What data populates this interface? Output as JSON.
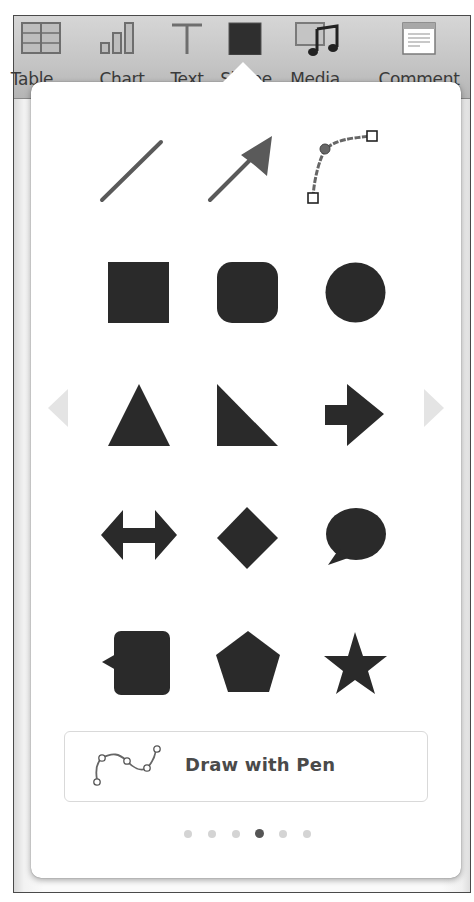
{
  "toolbar": {
    "items": [
      {
        "id": "table",
        "label": "Table",
        "icon": "table-icon"
      },
      {
        "id": "chart",
        "label": "Chart",
        "icon": "chart-icon"
      },
      {
        "id": "text",
        "label": "Text",
        "icon": "text-icon"
      },
      {
        "id": "shape",
        "label": "Shape",
        "icon": "shape-icon",
        "active": true
      },
      {
        "id": "media",
        "label": "Media",
        "icon": "media-icon"
      },
      {
        "id": "comment",
        "label": "Comment",
        "icon": "comment-icon"
      }
    ]
  },
  "shapes_popover": {
    "rows": [
      [
        "line",
        "arrow-line",
        "curve"
      ],
      [
        "square",
        "rounded-square",
        "circle"
      ],
      [
        "triangle",
        "right-triangle",
        "arrow-right"
      ],
      [
        "double-arrow",
        "diamond",
        "speech-bubble"
      ],
      [
        "callout-square",
        "pentagon",
        "star"
      ]
    ],
    "prev_page_icon": "chevron-left-icon",
    "next_page_icon": "chevron-right-icon",
    "draw_with_pen": {
      "label": "Draw with Pen",
      "icon": "pen-curve-icon"
    },
    "pagination": {
      "total": 6,
      "current": 4
    }
  },
  "colors": {
    "shape_fill": "#2a2a2a",
    "line_stroke": "#555555",
    "toolbar_bg": "#c8c8c8",
    "dot_inactive": "#d4d4d4",
    "dot_active": "#555555",
    "nav_arrow": "#e6e6e6"
  }
}
